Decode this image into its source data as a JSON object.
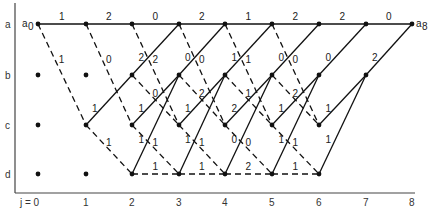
{
  "diagram": {
    "type": "trellis",
    "states": [
      "a",
      "b",
      "c",
      "d"
    ],
    "stages": [
      "j = 0",
      "1",
      "2",
      "3",
      "4",
      "5",
      "6",
      "7",
      "8"
    ],
    "start_label": "a",
    "start_sub": "0",
    "end_label": "a",
    "end_sub": "8",
    "colors": {
      "line": "#111111",
      "node": "#111111",
      "text": "#222222"
    }
  },
  "layout": {
    "x": [
      38,
      86,
      132,
      179,
      225,
      272,
      319,
      366,
      412
    ],
    "y": {
      "a": 24,
      "b": 75,
      "c": 125,
      "d": 174
    }
  },
  "isolated_nodes": [
    {
      "s": "b",
      "j": 0
    },
    {
      "s": "c",
      "j": 0
    },
    {
      "s": "d",
      "j": 0
    },
    {
      "s": "b",
      "j": 1
    },
    {
      "s": "d",
      "j": 1
    }
  ],
  "edges": [
    {
      "from": "a",
      "j": 0,
      "to": "a",
      "style": "solid",
      "label": "1"
    },
    {
      "from": "a",
      "j": 0,
      "to": "c",
      "style": "dashed",
      "label": "1"
    },
    {
      "from": "a",
      "j": 1,
      "to": "a",
      "style": "solid",
      "label": "2"
    },
    {
      "from": "a",
      "j": 1,
      "to": "c",
      "style": "dashed",
      "label": "0"
    },
    {
      "from": "c",
      "j": 1,
      "to": "b",
      "style": "solid",
      "label": "1"
    },
    {
      "from": "c",
      "j": 1,
      "to": "d",
      "style": "dashed",
      "label": "1"
    },
    {
      "from": "a",
      "j": 2,
      "to": "a",
      "style": "solid",
      "label": "0"
    },
    {
      "from": "a",
      "j": 2,
      "to": "c",
      "style": "dashed",
      "label": "2"
    },
    {
      "from": "b",
      "j": 2,
      "to": "a",
      "style": "solid",
      "label": "2"
    },
    {
      "from": "b",
      "j": 2,
      "to": "c",
      "style": "dashed",
      "label": "0"
    },
    {
      "from": "c",
      "j": 2,
      "to": "b",
      "style": "solid",
      "label": "1"
    },
    {
      "from": "c",
      "j": 2,
      "to": "d",
      "style": "dashed",
      "label": "1"
    },
    {
      "from": "d",
      "j": 2,
      "to": "b",
      "style": "solid",
      "label": "1"
    },
    {
      "from": "d",
      "j": 2,
      "to": "d",
      "style": "dashed",
      "label": "1"
    },
    {
      "from": "a",
      "j": 3,
      "to": "a",
      "style": "solid",
      "label": "2"
    },
    {
      "from": "a",
      "j": 3,
      "to": "c",
      "style": "dashed",
      "label": "0"
    },
    {
      "from": "b",
      "j": 3,
      "to": "a",
      "style": "solid",
      "label": "0"
    },
    {
      "from": "b",
      "j": 3,
      "to": "c",
      "style": "dashed",
      "label": "2"
    },
    {
      "from": "c",
      "j": 3,
      "to": "b",
      "style": "solid",
      "label": "1"
    },
    {
      "from": "c",
      "j": 3,
      "to": "d",
      "style": "dashed",
      "label": "1"
    },
    {
      "from": "d",
      "j": 3,
      "to": "b",
      "style": "solid",
      "label": "1"
    },
    {
      "from": "d",
      "j": 3,
      "to": "d",
      "style": "dashed",
      "label": "1"
    },
    {
      "from": "a",
      "j": 4,
      "to": "a",
      "style": "solid",
      "label": "1"
    },
    {
      "from": "a",
      "j": 4,
      "to": "c",
      "style": "dashed",
      "label": "1"
    },
    {
      "from": "b",
      "j": 4,
      "to": "a",
      "style": "solid",
      "label": "1"
    },
    {
      "from": "b",
      "j": 4,
      "to": "c",
      "style": "dashed",
      "label": "1"
    },
    {
      "from": "c",
      "j": 4,
      "to": "b",
      "style": "solid",
      "label": "2"
    },
    {
      "from": "c",
      "j": 4,
      "to": "d",
      "style": "dashed",
      "label": "0"
    },
    {
      "from": "d",
      "j": 4,
      "to": "b",
      "style": "solid",
      "label": "0"
    },
    {
      "from": "d",
      "j": 4,
      "to": "d",
      "style": "dashed",
      "label": "2"
    },
    {
      "from": "a",
      "j": 5,
      "to": "a",
      "style": "solid",
      "label": "2"
    },
    {
      "from": "a",
      "j": 5,
      "to": "c",
      "style": "dashed",
      "label": "0"
    },
    {
      "from": "b",
      "j": 5,
      "to": "a",
      "style": "solid",
      "label": "0"
    },
    {
      "from": "b",
      "j": 5,
      "to": "c",
      "style": "dashed",
      "label": "2"
    },
    {
      "from": "c",
      "j": 5,
      "to": "b",
      "style": "solid",
      "label": "1"
    },
    {
      "from": "c",
      "j": 5,
      "to": "d",
      "style": "dashed",
      "label": "1"
    },
    {
      "from": "d",
      "j": 5,
      "to": "b",
      "style": "solid",
      "label": "1"
    },
    {
      "from": "d",
      "j": 5,
      "to": "d",
      "style": "dashed",
      "label": "1"
    },
    {
      "from": "a",
      "j": 6,
      "to": "a",
      "style": "solid",
      "label": "2"
    },
    {
      "from": "b",
      "j": 6,
      "to": "a",
      "style": "solid",
      "label": "0"
    },
    {
      "from": "c",
      "j": 6,
      "to": "b",
      "style": "solid",
      "label": "1"
    },
    {
      "from": "d",
      "j": 6,
      "to": "b",
      "style": "solid",
      "label": "1"
    },
    {
      "from": "a",
      "j": 7,
      "to": "a",
      "style": "solid",
      "label": "0"
    },
    {
      "from": "b",
      "j": 7,
      "to": "a",
      "style": "solid",
      "label": "2"
    }
  ]
}
